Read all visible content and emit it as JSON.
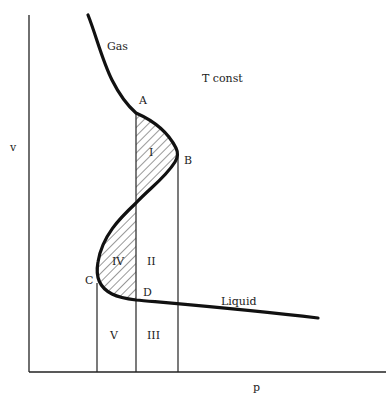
{
  "diagram": {
    "axes": {
      "x_label": "p",
      "y_label": "v"
    },
    "annotations": {
      "condition": "T  const",
      "gas": "Gas",
      "liquid": "Liquid"
    },
    "points": {
      "A": "A",
      "B": "B",
      "C": "C",
      "D": "D"
    },
    "regions": {
      "I": "I",
      "II": "II",
      "III": "III",
      "IV": "IV",
      "V": "V"
    },
    "colors": {
      "line": "#111111",
      "hatch": "#333333",
      "background": "#ffffff"
    }
  }
}
